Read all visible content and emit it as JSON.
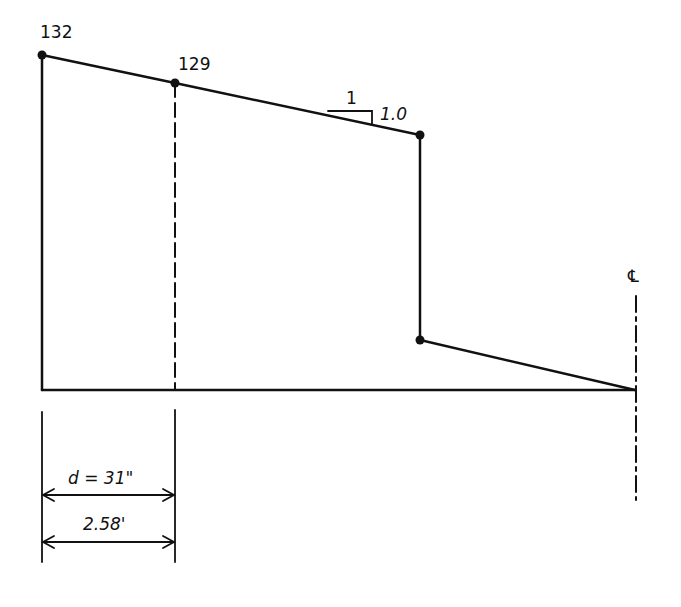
{
  "diagram": {
    "type": "moment/profile sketch",
    "labels": {
      "left_value": "132",
      "critical_value": "129",
      "slope_run": "1",
      "slope_rise": "1.0",
      "centerline": "℄",
      "dimension_inches": "d = 31\"",
      "dimension_feet": "2.58'"
    },
    "points": [
      {
        "name": "left-top",
        "value": "132"
      },
      {
        "name": "critical-section",
        "value": "129"
      },
      {
        "name": "step-top"
      },
      {
        "name": "step-bottom"
      },
      {
        "name": "centerline-zero"
      }
    ],
    "colors": {
      "ink": "#111111",
      "background": "#ffffff"
    }
  }
}
